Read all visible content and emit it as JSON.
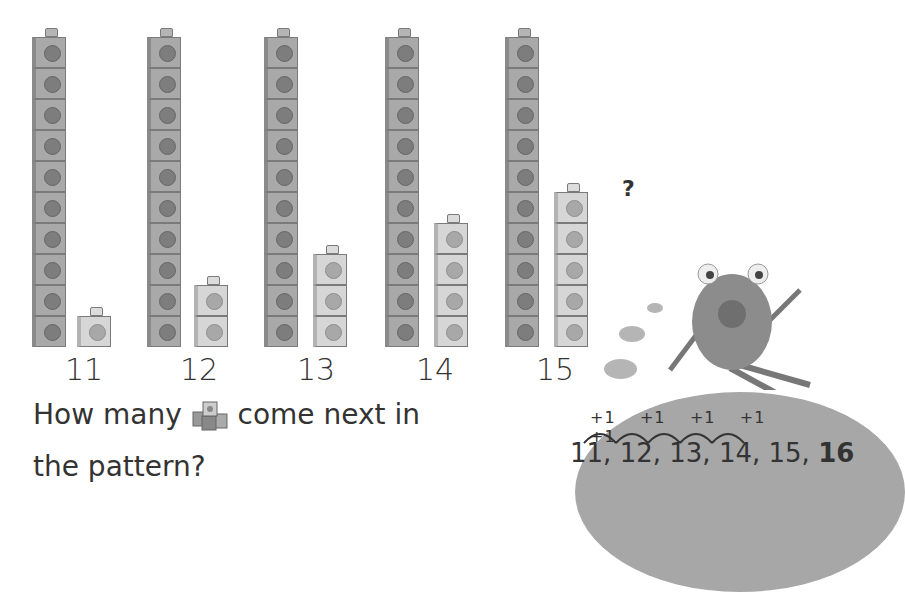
{
  "columns": [
    {
      "label": "11",
      "tens": 10,
      "ones": 1
    },
    {
      "label": "12",
      "tens": 10,
      "ones": 2
    },
    {
      "label": "13",
      "tens": 10,
      "ones": 3
    },
    {
      "label": "14",
      "tens": 10,
      "ones": 4
    },
    {
      "label": "15",
      "tens": 10,
      "ones": 5
    }
  ],
  "question_mark": "?",
  "prompt": {
    "line1_before": "How many ",
    "line1_after": " come next in",
    "line2": "the pattern?",
    "icon": "cubes-icon"
  },
  "pattern": {
    "steps": [
      "+1",
      "+1",
      "+1",
      "+1",
      "+1"
    ],
    "sequence": [
      "11,",
      "12,",
      "13,",
      "14,",
      "15,"
    ],
    "answer": "16"
  },
  "character": "monster-icon",
  "colors": {
    "tens_cube": "#a9a9a9",
    "ones_cube": "#d6d6d6",
    "blob": "#a7a7a7",
    "text": "#333333"
  }
}
